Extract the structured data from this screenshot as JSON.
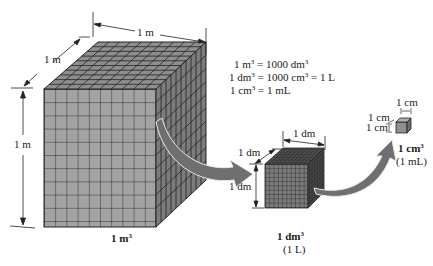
{
  "equations": [
    {
      "lhs_num": "1 m",
      "lhs_exp": "3",
      "mid": " = 1000 dm",
      "mid_exp": "3",
      "rhs": ""
    },
    {
      "lhs_num": "1 dm",
      "lhs_exp": "3",
      "mid": " = 1000 cm",
      "mid_exp": "3",
      "rhs": " = 1 L"
    },
    {
      "lhs_num": "1 cm",
      "lhs_exp": "3",
      "mid": " = 1 mL",
      "mid_exp": "",
      "rhs": ""
    }
  ],
  "cubes": {
    "large": {
      "width_label": "1 m",
      "depth_label": "1 m",
      "height_label": "1 m",
      "caption_base": "1 m",
      "caption_exp": "3",
      "caption_sub": "",
      "grid": 10,
      "face_color": "#9a9a9a",
      "top_color": "#8c8c8c",
      "side_color": "#7a7a7a"
    },
    "medium": {
      "width_label": "1 dm",
      "depth_label": "1 dm",
      "height_label": "1 dm",
      "caption_base": "1 dm",
      "caption_exp": "3",
      "caption_sub": "(1 L)",
      "grid": 10,
      "face_color": "#6e6e6e"
    },
    "small": {
      "width_label": "1 cm",
      "depth_label": "1 cm",
      "height_label": "1 cm",
      "caption_base": "1 cm",
      "caption_exp": "3",
      "caption_sub": "(1 mL)",
      "face_color": "#8a8a8a"
    }
  },
  "arrow_color": "#6f6f6f"
}
